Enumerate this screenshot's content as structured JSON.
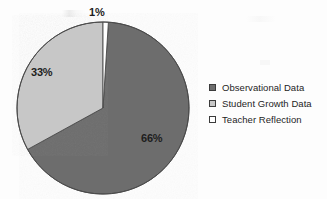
{
  "chart_data": {
    "type": "pie",
    "title": "",
    "subtitle": "",
    "xlabel": "",
    "ylabel": "",
    "legend_position": "right",
    "grid": false,
    "start_angle_oclock": 12,
    "direction": "clockwise",
    "categories": [
      "Observational Data",
      "Student Growth Data",
      "Teacher Reflection"
    ],
    "values": [
      66,
      33,
      1
    ],
    "units": "percent",
    "slices": [
      {
        "label": "Observational Data",
        "value": 66,
        "value_text": "66%",
        "color": "#6d6d6d",
        "legend_swatch": "filled-dark"
      },
      {
        "label": "Student Growth Data",
        "value": 33,
        "value_text": "33%",
        "color": "#c7c7c7",
        "legend_swatch": "filled-light"
      },
      {
        "label": "Teacher Reflection",
        "value": 1,
        "value_text": "1%",
        "color": "#ffffff",
        "legend_swatch": "empty-white"
      }
    ],
    "data_labels": [
      "1%",
      "33%",
      "66%"
    ]
  },
  "pie": {
    "center_x": 103,
    "center_y": 108,
    "radius": 86,
    "outline_color": "#4a4a4a",
    "labels": {
      "teacher_reflection": "1%",
      "student_growth": "33%",
      "observational": "66%"
    }
  },
  "legend": {
    "items": [
      {
        "label": "Observational Data",
        "color": "#6d6d6d",
        "border": "#3b3b3b"
      },
      {
        "label": "Student Growth Data",
        "color": "#c7c7c7",
        "border": "#3b3b3b"
      },
      {
        "label": "Teacher Reflection",
        "color": "#ffffff",
        "border": "#3b3b3b"
      }
    ]
  },
  "colors": {
    "background": "#fdfdfd",
    "dark_slice": "#6d6d6d",
    "light_slice": "#c7c7c7",
    "white_slice": "#ffffff",
    "text": "#1d1d1d",
    "outline": "#4a4a4a"
  }
}
